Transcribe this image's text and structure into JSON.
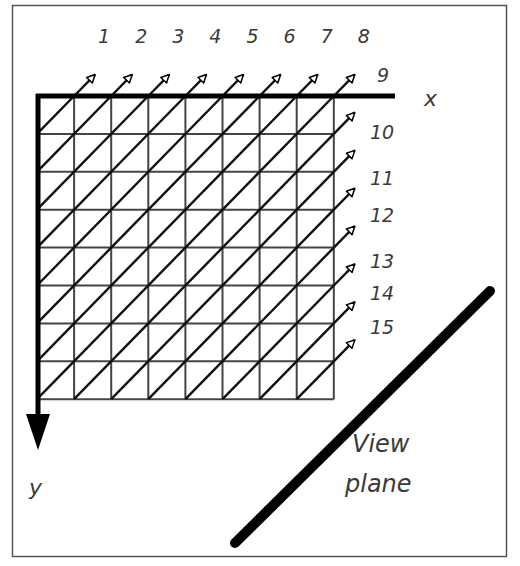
{
  "diagram": {
    "frame": {
      "x": 12,
      "y": 5,
      "width": 495,
      "height": 552,
      "color": "#555555"
    },
    "grid": {
      "x": 37,
      "y": 96,
      "cols": 8,
      "rows": 8,
      "cell_w": 37.1,
      "cell_h": 37.9,
      "line_color": "#444444"
    },
    "axes": {
      "x_label": "x",
      "y_label": "y",
      "x_axis_end": 395,
      "y_arrow_tip": 450,
      "color": "#000000"
    },
    "rays": {
      "top_labels": [
        "1",
        "2",
        "3",
        "4",
        "5",
        "6",
        "7",
        "8"
      ],
      "right_labels": [
        "9",
        "10",
        "11",
        "12",
        "13",
        "14",
        "15"
      ],
      "arrow_style": "open-triangle"
    },
    "view_plane": {
      "label_line1": "View",
      "label_line2": "plane",
      "x1": 235,
      "y1": 543,
      "x2": 490,
      "y2": 291,
      "color": "#000000"
    }
  }
}
